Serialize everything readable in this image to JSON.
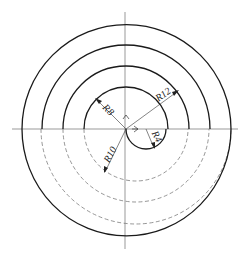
{
  "drawing": {
    "type": "spiral construction (concentric semicircles)",
    "dimensions": [
      {
        "id": "r8",
        "label": "R8"
      },
      {
        "id": "r12",
        "label": "R12"
      },
      {
        "id": "r10",
        "label": "R10"
      },
      {
        "id": "r4",
        "label": "R4"
      }
    ],
    "colors": {
      "line": "#1a1a1a",
      "hidden_line": "#6a6a6a",
      "background": "#ffffff"
    }
  }
}
